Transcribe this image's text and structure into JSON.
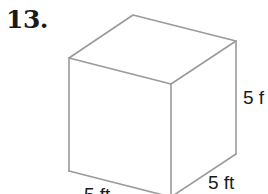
{
  "problem": {
    "number": "13."
  },
  "figure": {
    "shape": "cube",
    "edge_color": "#9a9a9a",
    "labels": {
      "height": "5 f",
      "depth": "5 ft",
      "width": "5 ft"
    }
  }
}
